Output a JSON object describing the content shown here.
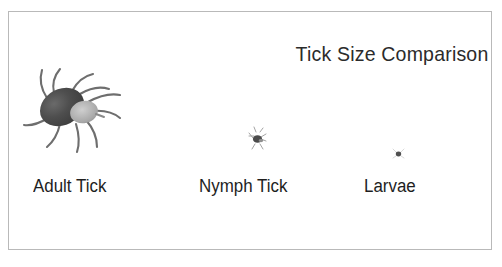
{
  "figure": {
    "title": "Tick Size Comparison",
    "background_color": "#ffffff",
    "border_color": "#b9b9b9",
    "text_color": "#1e1e1e",
    "tick_body_color": "#4a4a4a",
    "tick_head_color": "#b0b0b0",
    "tick_leg_color": "#6b6b6b"
  },
  "specimens": [
    {
      "label": "Adult Tick",
      "icon": "adult-tick-icon",
      "relative_size": "large"
    },
    {
      "label": "Nymph Tick",
      "icon": "nymph-tick-icon",
      "relative_size": "small"
    },
    {
      "label": "Larvae",
      "icon": "larvae-tick-icon",
      "relative_size": "tiny"
    }
  ]
}
